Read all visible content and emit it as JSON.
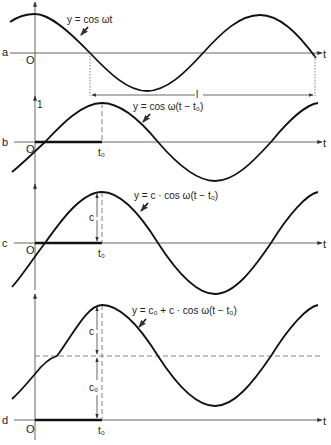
{
  "figure": {
    "panels": [
      {
        "id": "a",
        "label": "a",
        "origin_label": "O",
        "t_label": "t",
        "equation": "y = cos ωt",
        "period_label": "l"
      },
      {
        "id": "b",
        "label": "b",
        "origin_label": "O",
        "t_label": "t",
        "y_tick": "1",
        "t0_label": "t₀",
        "equation": "y = cos ω(t − t₀)"
      },
      {
        "id": "c",
        "label": "c",
        "origin_label": "O",
        "t_label": "t",
        "t0_label": "t₀",
        "amplitude_label": "c",
        "equation": "y = c · cos ω(t − t₀)"
      },
      {
        "id": "d",
        "label": "d",
        "origin_label": "O",
        "t_label": "t",
        "t0_label": "t₀",
        "amplitude_label": "c",
        "offset_label": "c₀",
        "equation": "y = c₀ + c · cos ω(t − t₀)"
      }
    ]
  }
}
